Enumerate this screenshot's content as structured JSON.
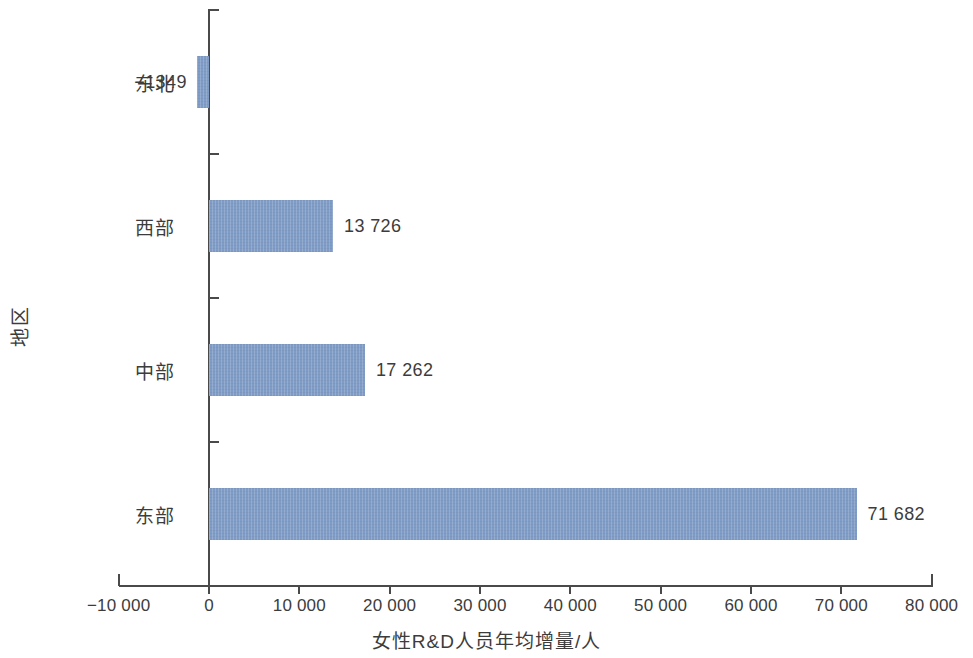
{
  "chart_data": {
    "type": "bar",
    "orientation": "horizontal",
    "title": "",
    "xlabel": "女性R&D人员年均增量/人",
    "ylabel": "地区",
    "categories": [
      "东北",
      "西部",
      "中部",
      "东部"
    ],
    "values": [
      -1349,
      13726,
      17262,
      71682
    ],
    "value_labels": [
      "−1349",
      "13 726",
      "17 262",
      "71 682"
    ],
    "xlim": [
      -10000,
      80000
    ],
    "xticks": [
      -10000,
      0,
      10000,
      20000,
      30000,
      40000,
      50000,
      60000,
      70000,
      80000
    ],
    "xtick_labels": [
      "−10 000",
      "0",
      "10 000",
      "20 000",
      "30 000",
      "40 000",
      "50 000",
      "60 000",
      "70 000",
      "80 000"
    ],
    "grid": false,
    "legend": false,
    "bar_color": "#7f9cc6",
    "axis_color": "#4a4a4a",
    "text_color": "#3c3c3c",
    "background_color": "#ffffff",
    "series": [
      {
        "name": "女性R&D人员年均增量",
        "points": [
          {
            "category": "东北",
            "value": -1349,
            "label": "−1349"
          },
          {
            "category": "西部",
            "value": 13726,
            "label": "13 726"
          },
          {
            "category": "中部",
            "value": 17262,
            "label": "17 262"
          },
          {
            "category": "东部",
            "value": 71682,
            "label": "71 682"
          }
        ]
      }
    ]
  }
}
